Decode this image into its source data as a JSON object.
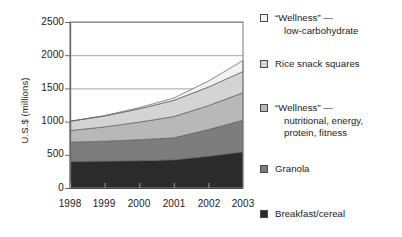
{
  "chart_data": {
    "type": "area",
    "stacked": true,
    "title": "",
    "xlabel": "",
    "ylabel": "U.S.$ (millions)",
    "categories": [
      "1998",
      "1999",
      "2000",
      "2001",
      "2002",
      "2003"
    ],
    "x": [
      1998,
      1999,
      2000,
      2001,
      2002,
      2003
    ],
    "ylim": [
      0,
      2500
    ],
    "yticks": [
      0,
      500,
      1000,
      1500,
      2000,
      2500
    ],
    "ytick_labels": [
      "0",
      "500",
      "1000",
      "1500",
      "2000",
      "2500"
    ],
    "grid": true,
    "grid_axis": "y",
    "legend_position": "right",
    "series": [
      {
        "name": "Breakfast/cereal",
        "color": "#2b2b2b",
        "values": [
          400,
          405,
          412,
          425,
          480,
          545
        ]
      },
      {
        "name": "Granola",
        "color": "#7d7d7d",
        "values": [
          290,
          300,
          315,
          330,
          400,
          475
        ]
      },
      {
        "name": "“Wellness” — nutritional, energy, protein, fitness",
        "color": "#b8b8b8",
        "values": [
          175,
          215,
          265,
          320,
          360,
          415
        ]
      },
      {
        "name": "Rice snack squares",
        "color": "#d4d4d4",
        "values": [
          140,
          165,
          200,
          245,
          280,
          320
        ]
      },
      {
        "name": "“Wellness” — low-carbohydrate",
        "color": "#f2f2f2",
        "values": [
          0,
          5,
          18,
          35,
          90,
          165
        ]
      }
    ],
    "totals": [
      1005,
      1090,
      1210,
      1355,
      1610,
      1920
    ]
  },
  "legend": {
    "items": [
      {
        "label_line1": "“Wellness” —",
        "label_line2": "low-carbohydrate",
        "color": "#f2f2f2"
      },
      {
        "label_line1": "Rice snack squares",
        "label_line2": "",
        "color": "#d4d4d4"
      },
      {
        "label_line1": "“Wellness” —",
        "label_line2": "nutritional, energy,",
        "label_line3": "protein, fitness",
        "color": "#b8b8b8"
      },
      {
        "label_line1": "Granola",
        "label_line2": "",
        "color": "#7d7d7d"
      },
      {
        "label_line1": "Breakfast/cereal",
        "label_line2": "",
        "color": "#2b2b2b"
      }
    ]
  },
  "axes": {
    "y_title": "U.S.$ (millions)",
    "y_labels": [
      "2500",
      "2000",
      "1500",
      "1000",
      "500",
      "0"
    ],
    "x_labels": [
      "1998",
      "1999",
      "2000",
      "2001",
      "2002",
      "2003"
    ]
  },
  "colors": {
    "axis": "#7a7a7a",
    "grid": "#9a9a9a",
    "text": "#1a1a1a",
    "background": "#ffffff"
  }
}
